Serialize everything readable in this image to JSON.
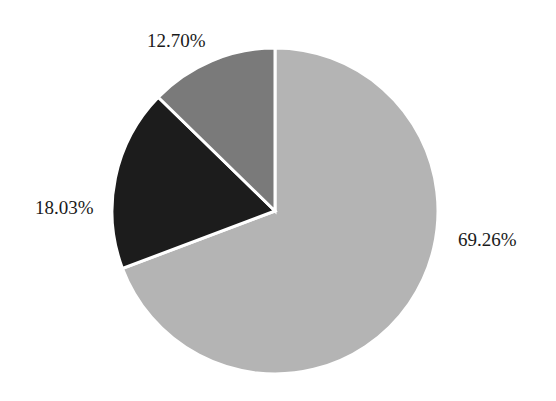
{
  "chart_data": {
    "type": "pie",
    "title": "",
    "start_angle_deg": 0,
    "direction": "clockwise",
    "slices": [
      {
        "label": "69.26%",
        "value": 69.26,
        "color": "#b4b4b4"
      },
      {
        "label": "18.03%",
        "value": 18.03,
        "color": "#1c1c1c"
      },
      {
        "label": "12.70%",
        "value": 12.7,
        "color": "#7a7a7a"
      }
    ],
    "values": [
      69.26,
      18.03,
      12.7
    ],
    "labels": [
      "69.26%",
      "18.03%",
      "12.70%"
    ],
    "legend": null,
    "label_positions": "outside"
  },
  "labels": {
    "slice_0": "69.26%",
    "slice_1": "18.03%",
    "slice_2": "12.70%"
  },
  "colors": {
    "slice_0": "#b4b4b4",
    "slice_1": "#1c1c1c",
    "slice_2": "#7a7a7a",
    "separator": "#ffffff",
    "background": "#ffffff"
  }
}
